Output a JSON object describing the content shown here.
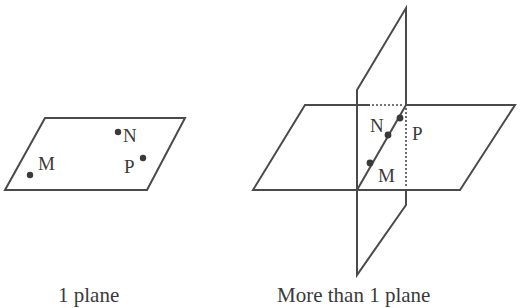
{
  "figures": [
    {
      "id": "one-plane",
      "caption": "1 plane",
      "points": [
        {
          "label": "M"
        },
        {
          "label": "N"
        },
        {
          "label": "P"
        }
      ]
    },
    {
      "id": "more-than-one-plane",
      "caption": "More than 1 plane",
      "points": [
        {
          "label": "N"
        },
        {
          "label": "P"
        },
        {
          "label": "M"
        }
      ]
    }
  ],
  "colors": {
    "stroke": "#4a4a4a",
    "text": "#3a3a3a"
  }
}
